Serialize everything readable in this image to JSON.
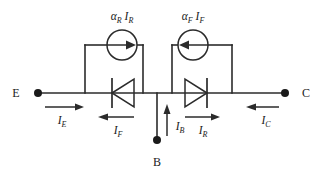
{
  "diagram": {
    "type": "circuit-schematic",
    "background_color": "#ffffff",
    "line_color": "#2b2b2b"
  },
  "terminals": [
    {
      "id": "emitter",
      "label": "E",
      "position": "left"
    },
    {
      "id": "collector",
      "label": "C",
      "position": "right"
    },
    {
      "id": "base",
      "label": "B",
      "position": "bottom"
    }
  ],
  "current_sources": [
    {
      "id": "left-source",
      "coefficient": "α",
      "coefficient_sub": "R",
      "current": "I",
      "current_sub": "R",
      "label": "αR IR",
      "arrow_direction": "right"
    },
    {
      "id": "right-source",
      "coefficient": "α",
      "coefficient_sub": "F",
      "current": "I",
      "current_sub": "F",
      "label": "αF IF",
      "arrow_direction": "left"
    }
  ],
  "diodes": [
    {
      "id": "forward-diode",
      "orientation": "cathode-left",
      "branch": "emitter"
    },
    {
      "id": "reverse-diode",
      "orientation": "cathode-right",
      "branch": "collector"
    }
  ],
  "current_labels": [
    {
      "id": "i-e",
      "symbol": "I",
      "subscript": "E",
      "arrow_direction": "right"
    },
    {
      "id": "i-f",
      "symbol": "I",
      "subscript": "F",
      "arrow_direction": "left"
    },
    {
      "id": "i-b",
      "symbol": "I",
      "subscript": "B",
      "arrow_direction": "up"
    },
    {
      "id": "i-r",
      "symbol": "I",
      "subscript": "R",
      "arrow_direction": "right"
    },
    {
      "id": "i-c",
      "symbol": "I",
      "subscript": "C",
      "arrow_direction": "left"
    }
  ]
}
